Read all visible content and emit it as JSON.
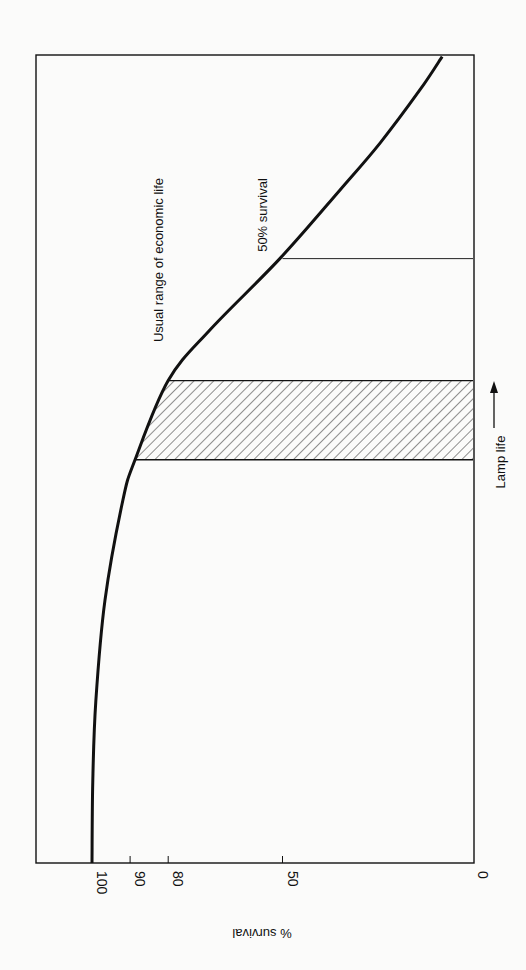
{
  "chart_data": {
    "type": "line",
    "orientation": "rotated-90-clockwise",
    "title": "",
    "xlabel": "Lamp life",
    "ylabel": "% survival",
    "xlim": [
      0,
      1
    ],
    "ylim": [
      0,
      100
    ],
    "y_ticks": [
      {
        "value": 100,
        "label": "100"
      },
      {
        "value": 90,
        "label": "90"
      },
      {
        "value": 80,
        "label": "80"
      },
      {
        "value": 50,
        "label": "50"
      },
      {
        "value": 0,
        "label": "0"
      }
    ],
    "x_ticks": [],
    "grid": false,
    "legend": "none",
    "series": [
      {
        "name": "Lamp survival curve",
        "x": [
          0,
          0.1,
          0.2,
          0.325,
          0.449,
          0.499,
          0.597,
          0.66,
          0.748,
          0.833,
          0.891,
          0.957,
          0.998
        ],
        "y": [
          100,
          99.8,
          99,
          96.6,
          91.9,
          88.7,
          80,
          69,
          50.7,
          34.9,
          24.4,
          13.9,
          8.1
        ]
      }
    ],
    "annotations": [
      {
        "type": "shaded-band",
        "label": "Usual range of economic life",
        "x_range": [
          0.499,
          0.597
        ],
        "y_range": [
          80,
          88.7
        ],
        "pattern": "diagonal-hatch"
      },
      {
        "type": "reference-line",
        "label": "50% survival",
        "x": 0.748,
        "y_range": [
          0,
          50
        ]
      }
    ]
  },
  "labels": {
    "economic_life": "Usual range of economic life",
    "fifty_survival": "50% survival",
    "lamp_life": "Lamp life",
    "survival_axis": "% survival"
  },
  "colors": {
    "ink": "#111111",
    "paper": "#fbfbfa"
  }
}
